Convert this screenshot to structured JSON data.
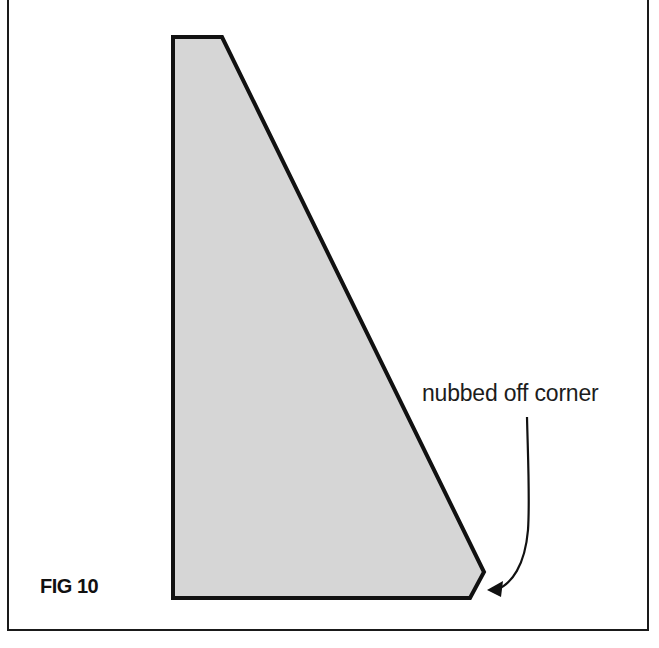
{
  "figure": {
    "caption": "FIG 10",
    "annotation": "nubbed off corner"
  },
  "shape": {
    "type": "quadrilateral-wedge",
    "fill": "#d6d6d6",
    "stroke": "#111111",
    "points": [
      [
        173,
        37
      ],
      [
        222,
        37
      ],
      [
        484,
        572
      ],
      [
        470,
        598
      ],
      [
        173,
        598
      ]
    ],
    "nub_vertex": [
      484,
      572
    ]
  },
  "leader": {
    "start": [
      527,
      417
    ],
    "arrow_tip": [
      488,
      590
    ],
    "stroke": "#111111"
  },
  "colors": {
    "background": "#ffffff",
    "frame": "#1a1a1a",
    "text": "#1c1c1c"
  }
}
